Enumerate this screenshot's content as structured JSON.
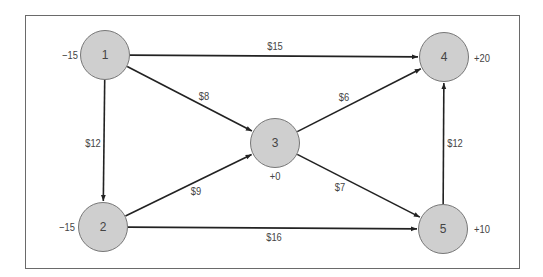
{
  "diagram": {
    "type": "transportation-network",
    "nodes": [
      {
        "id": "1",
        "label": "1",
        "supply": "−15",
        "x": 105,
        "y": 55,
        "sx": 70,
        "sy": 55
      },
      {
        "id": "2",
        "label": "2",
        "supply": "−15",
        "x": 103,
        "y": 227,
        "sx": 67,
        "sy": 227
      },
      {
        "id": "3",
        "label": "3",
        "supply": "+0",
        "x": 275,
        "y": 143,
        "sx": 275,
        "sy": 176
      },
      {
        "id": "4",
        "label": "4",
        "supply": "+20",
        "x": 444,
        "y": 57,
        "sx": 482,
        "sy": 58
      },
      {
        "id": "5",
        "label": "5",
        "supply": "+10",
        "x": 443,
        "y": 229,
        "sx": 482,
        "sy": 229
      }
    ],
    "edges": [
      {
        "from": "1",
        "to": "4",
        "cost": "$15",
        "lx": 275,
        "ly": 46
      },
      {
        "from": "1",
        "to": "3",
        "cost": "$8",
        "lx": 204,
        "ly": 96
      },
      {
        "from": "1",
        "to": "2",
        "cost": "$12",
        "lx": 93,
        "ly": 143
      },
      {
        "from": "2",
        "to": "3",
        "cost": "$9",
        "lx": 196,
        "ly": 191
      },
      {
        "from": "2",
        "to": "5",
        "cost": "$16",
        "lx": 274,
        "ly": 237
      },
      {
        "from": "3",
        "to": "4",
        "cost": "$6",
        "lx": 344,
        "ly": 97
      },
      {
        "from": "3",
        "to": "5",
        "cost": "$7",
        "lx": 340,
        "ly": 187
      },
      {
        "from": "5",
        "to": "4",
        "cost": "$12",
        "lx": 455,
        "ly": 143
      }
    ]
  },
  "colors": {
    "node_fill": "#cfcfcf",
    "node_border": "#777777",
    "edge": "#222222",
    "text": "#444444",
    "frame": "#6a6a6a"
  }
}
